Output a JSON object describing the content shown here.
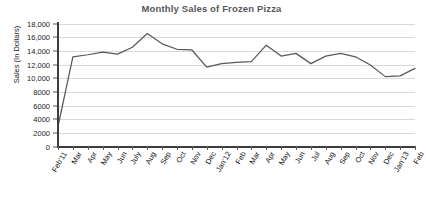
{
  "chart_data": {
    "type": "line",
    "title": "Monthly Sales of Frozen Pizza",
    "xlabel": "",
    "ylabel": "Sales (In Dollars)",
    "ylim": [
      0,
      18000
    ],
    "ytick_step": 2000,
    "ytick_labels": [
      "18,000",
      "16,000",
      "14,000",
      "12,000",
      "10,000",
      "8000",
      "6000",
      "4000",
      "2000",
      "0"
    ],
    "ytick_values": [
      18000,
      16000,
      14000,
      12000,
      10000,
      8000,
      6000,
      4000,
      2000,
      0
    ],
    "grid": "horizontal",
    "legend": "none",
    "markers": "none",
    "line_color": "#595959",
    "categories": [
      "Feb'11",
      "Mar",
      "Apr",
      "May",
      "Jun",
      "July",
      "Aug",
      "Sep",
      "Oct",
      "Nov",
      "Dec",
      "Jan'12",
      "Feb",
      "Mar",
      "Apr",
      "May",
      "Jun",
      "Jul",
      "Aug",
      "Sep",
      "Oct",
      "Nov",
      "Dec",
      "Jan'13",
      "Feb"
    ],
    "series": [
      {
        "name": "Monthly Sales",
        "values": [
          3000,
          13200,
          13500,
          13900,
          13600,
          14600,
          16600,
          15100,
          14300,
          14200,
          11700,
          12200,
          12400,
          12500,
          14900,
          13300,
          13700,
          12200,
          13300,
          13700,
          13200,
          12000,
          10300,
          10400,
          11500
        ]
      }
    ]
  },
  "colors": {
    "title": "#595959",
    "line": "#595959",
    "grid": "#d9d9d9",
    "axis": "#3d3d3d",
    "text": "#111111"
  }
}
